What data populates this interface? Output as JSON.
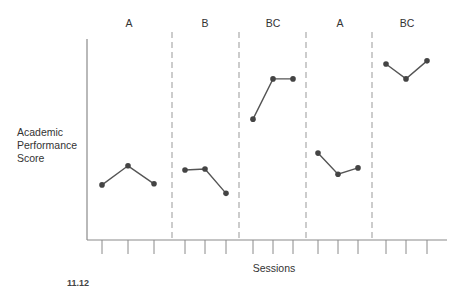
{
  "chart_data": {
    "type": "line",
    "title": "",
    "xlabel": "Sessions",
    "ylabel": "Academic Performance Score",
    "ylabel_lines": [
      "Academic",
      "Performance",
      "Score"
    ],
    "grid": false,
    "legend": null,
    "phases": [
      {
        "label": "A",
        "sessions": [
          1,
          2,
          3
        ],
        "values": [
          26,
          35,
          26.5
        ]
      },
      {
        "label": "B",
        "sessions": [
          4,
          5,
          6
        ],
        "values": [
          33,
          33.5,
          22
        ]
      },
      {
        "label": "BC",
        "sessions": [
          7,
          8,
          9
        ],
        "values": [
          57,
          76,
          76
        ]
      },
      {
        "label": "A",
        "sessions": [
          10,
          11,
          12
        ],
        "values": [
          41,
          31,
          34
        ]
      },
      {
        "label": "BC",
        "sessions": [
          13,
          14,
          15
        ],
        "values": [
          83,
          76,
          84.5
        ]
      }
    ],
    "x": [
      1,
      2,
      3,
      4,
      5,
      6,
      7,
      8,
      9,
      10,
      11,
      12,
      13,
      14,
      15
    ],
    "values": [
      26,
      35,
      26.5,
      33,
      33.5,
      22,
      57,
      76,
      76,
      41,
      31,
      34,
      83,
      76,
      84.5
    ],
    "ylim": [
      0,
      100
    ],
    "phase_separators": "dashed vertical lines",
    "annotations": [
      "Values estimated from pixel position; y-axis has no tick labels"
    ]
  },
  "labels": {
    "phase_labels": [
      "A",
      "B",
      "BC",
      "A",
      "BC"
    ],
    "ylabel_lines": [
      "Academic",
      "Performance",
      "Score"
    ],
    "xlabel": "Sessions",
    "caption_fragment": "11.12"
  }
}
